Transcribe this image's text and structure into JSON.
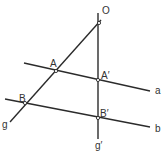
{
  "diagram": {
    "colors": {
      "line": "#2b2b2b",
      "label": "#333333",
      "background": "#ffffff"
    },
    "points": [
      {
        "id": "O",
        "label": "O",
        "x": 99,
        "y": 23
      },
      {
        "id": "A",
        "label": "A",
        "x": 56,
        "y": 71
      },
      {
        "id": "A_prime",
        "label": "A′",
        "x": 98,
        "y": 80
      },
      {
        "id": "B",
        "label": "B",
        "x": 25,
        "y": 103
      },
      {
        "id": "B_prime",
        "label": "B′",
        "x": 98,
        "y": 118
      }
    ],
    "lines": [
      {
        "id": "g",
        "label": "g",
        "x1": 101,
        "y1": 20,
        "x2": 10,
        "y2": 122
      },
      {
        "id": "g_prime",
        "label": "g′",
        "x1": 98,
        "y1": 13,
        "x2": 98,
        "y2": 139
      },
      {
        "id": "a",
        "label": "a",
        "x1": 24,
        "y1": 63,
        "x2": 150,
        "y2": 91
      },
      {
        "id": "b",
        "label": "b",
        "x1": 5,
        "y1": 99,
        "x2": 150,
        "y2": 127
      }
    ],
    "labels": {
      "O": "O",
      "A": "A",
      "A_prime": "A′",
      "B": "B",
      "B_prime": "B′",
      "g": "g",
      "g_prime": "g′",
      "a": "a",
      "b": "b"
    }
  }
}
